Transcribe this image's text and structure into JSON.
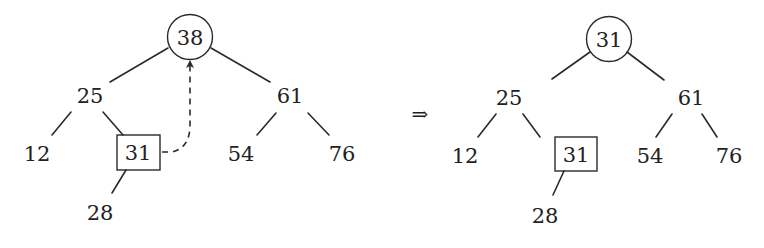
{
  "arrow_symbol": "⇒",
  "colors": {
    "ink": "#222222",
    "background": "#ffffff"
  },
  "before": {
    "root": "38",
    "left": "25",
    "right": "61",
    "left_left": "12",
    "left_right": "31",
    "right_left": "54",
    "right_right": "76",
    "left_right_left": "28",
    "root_shape": "circle",
    "highlighted_shape": "box",
    "move_arrow": "dashed arrow from 31 to root"
  },
  "after": {
    "root": "31",
    "left": "25",
    "right": "61",
    "left_left": "12",
    "left_right": "31",
    "right_left": "54",
    "right_right": "76",
    "left_right_left": "28",
    "root_shape": "circle",
    "highlighted_shape": "box"
  }
}
